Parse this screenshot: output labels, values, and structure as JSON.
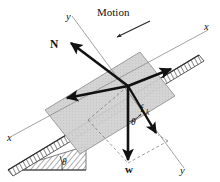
{
  "figure": {
    "kind": "free-body-diagram",
    "background_color": "#ffffff",
    "ink_color": "#111111",
    "block_fill_color": "#cfcfcf",
    "axis_color": "#8a8a8a",
    "incline_fill_color": "#9a9a9a"
  },
  "labels": {
    "motion": "Motion",
    "normal_force": "N",
    "friction_force_symbol": "f",
    "friction_force_subscript": "k",
    "weight": "w",
    "axis_x_upper_right": "x",
    "axis_x_lower_left": "x",
    "axis_y_upper": "y",
    "axis_y_lower_right": "y",
    "angle_incline": "θ",
    "angle_weight": "θ"
  },
  "vectors": [
    {
      "name": "normal-force",
      "label": "N",
      "origin": [
        128,
        86
      ],
      "tip": [
        70,
        42
      ],
      "style": "bold-solid",
      "description": "normal force perpendicular to incline surface"
    },
    {
      "name": "friction-force",
      "label": "fk",
      "origin": [
        128,
        86
      ],
      "tip": [
        172,
        68
      ],
      "style": "bold-solid",
      "description": "kinetic friction up the incline"
    },
    {
      "name": "weight",
      "label": "w",
      "origin": [
        128,
        86
      ],
      "tip": [
        128,
        163
      ],
      "style": "bold-solid",
      "description": "weight acting vertically downward"
    },
    {
      "name": "weight-component-along-incline",
      "label": "",
      "origin": [
        128,
        86
      ],
      "tip": [
        66,
        98
      ],
      "style": "bold-solid",
      "description": "component of weight parallel to incline, down-slope"
    },
    {
      "name": "weight-component-perpendicular",
      "label": "",
      "origin": [
        128,
        86
      ],
      "tip": [
        158,
        135
      ],
      "style": "bold-solid",
      "description": "component of weight perpendicular to incline"
    },
    {
      "name": "motion-indicator",
      "label": "Motion",
      "origin": [
        148,
        22
      ],
      "tip": [
        116,
        38
      ],
      "style": "thin-solid",
      "description": "arrow indicating direction of block motion down the incline"
    }
  ],
  "axes": [
    {
      "name": "x-axis",
      "from": [
        12,
        136
      ],
      "to": [
        208,
        30
      ],
      "label_start": "x",
      "label_end": "x",
      "description": "x axis aligned with the inclined surface"
    },
    {
      "name": "y-axis",
      "from": [
        72,
        16
      ],
      "to": [
        184,
        168
      ],
      "label_start": "y",
      "label_end": "y",
      "description": "y axis perpendicular to the inclined surface"
    }
  ],
  "angles": [
    {
      "name": "incline-angle",
      "symbol": "θ",
      "position": [
        50,
        160
      ],
      "description": "angle of incline measured at the base of the wedge"
    },
    {
      "name": "weight-axis-angle",
      "symbol": "θ",
      "position": [
        122,
        122
      ],
      "description": "angle between weight vector and y axis, equal to incline angle"
    }
  ],
  "construction_lines": {
    "style": "dashed",
    "description": "dashed parallelogram showing resolution of weight into components"
  }
}
